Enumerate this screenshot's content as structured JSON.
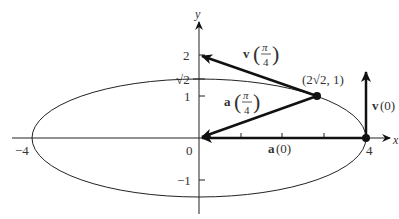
{
  "diagram": {
    "title": "",
    "axes": {
      "x_label": "x",
      "y_label": "y",
      "x_ticks": [
        {
          "value": -4,
          "label": "−4"
        },
        {
          "value": 0,
          "label": "0"
        },
        {
          "value": 4,
          "label": "4"
        }
      ],
      "y_ticks": [
        {
          "value": 2,
          "label": "2"
        },
        {
          "value": 1.414,
          "label": "√2"
        },
        {
          "value": 1,
          "label": "1"
        },
        {
          "value": -1,
          "label": "−1"
        }
      ]
    },
    "ellipse": {
      "a": 4,
      "b": 1.414
    },
    "point_label": "(2√2, 1)",
    "vectors": {
      "v_pi4": {
        "name": "v",
        "arg_num": "π",
        "arg_den": "4",
        "from": [
          2.828,
          1
        ],
        "to": [
          0,
          2
        ]
      },
      "a_pi4": {
        "name": "a",
        "arg_num": "π",
        "arg_den": "4",
        "from": [
          2.828,
          1
        ],
        "to": [
          0,
          0
        ]
      },
      "v_0": {
        "label": "v(0)",
        "name": "v",
        "arg": "(0)",
        "from": [
          4,
          0
        ],
        "to": [
          4,
          1.414
        ]
      },
      "a_0": {
        "label": "a(0)",
        "name": "a",
        "arg": "(0)",
        "from": [
          4,
          0
        ],
        "to": [
          0,
          0
        ]
      }
    },
    "colors": {
      "line": "#111111",
      "text": "#333333",
      "background": "#ffffff"
    }
  }
}
